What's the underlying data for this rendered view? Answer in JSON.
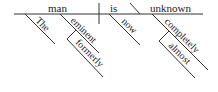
{
  "diagram": {
    "type": "reed-kellogg sentence diagram",
    "sentence": "The eminent man is now almost completely unknown",
    "baseline": {
      "subject": "man",
      "verb": "is",
      "predicate_adjective": "unknown"
    },
    "modifiers": {
      "the": "The",
      "eminent": "eminent",
      "formerly": "formerly",
      "now": "now",
      "completely": "completely",
      "almost": "almost"
    },
    "colors": {
      "line": "#333333",
      "text": "#222222"
    }
  }
}
